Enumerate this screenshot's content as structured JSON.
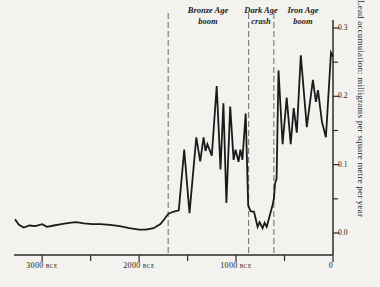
{
  "page": {
    "background_color": "#f4f2ee",
    "line_color": "#1b1b1b",
    "axis_color": "#2a2a2a",
    "dashed_line_color": "#6a6a6a"
  },
  "chart_data": {
    "type": "line",
    "title": "",
    "ylabel": "Lead accumulation: milligrams per square metre per year",
    "x_axis": {
      "unit": "years BCE",
      "range_years_bce": [
        3280,
        0
      ],
      "ticks": [
        {
          "year": 3000,
          "label": "3000",
          "era": "BCE"
        },
        {
          "year": 2000,
          "label": "2000",
          "era": "BCE"
        },
        {
          "year": 1000,
          "label": "1000",
          "era": "BCE"
        },
        {
          "year": 0,
          "label": "0",
          "era": ""
        }
      ],
      "minor_tick_years": [
        2500,
        1500,
        500
      ]
    },
    "y_axis": {
      "range": [
        0.0,
        0.3
      ],
      "ticks": [
        {
          "value": 0.3,
          "label": "0.3"
        },
        {
          "value": 0.2,
          "label": "0.2"
        },
        {
          "value": 0.1,
          "label": "0.1"
        },
        {
          "value": 0.0,
          "label": "0.0"
        }
      ],
      "minor_tick_values": [
        0.25,
        0.15,
        0.05
      ]
    },
    "annotations": [
      {
        "line1": "Bronze Age",
        "line2": "boom",
        "start_year_bce": 1700,
        "end_year_bce": 870
      },
      {
        "line1": "Dark Age",
        "line2": "crash",
        "start_year_bce": 870,
        "end_year_bce": 610
      },
      {
        "line1": "Iron Age",
        "line2": "boom",
        "start_year_bce": 610,
        "end_year_bce": 0
      }
    ],
    "divider_years_bce": [
      1700,
      870,
      610
    ],
    "series": [
      {
        "name": "lead-accumulation",
        "points_year_bce_value": [
          [
            3280,
            0.02
          ],
          [
            3240,
            0.012
          ],
          [
            3190,
            0.008
          ],
          [
            3130,
            0.011
          ],
          [
            3070,
            0.01
          ],
          [
            3000,
            0.013
          ],
          [
            2950,
            0.009
          ],
          [
            2880,
            0.011
          ],
          [
            2800,
            0.013
          ],
          [
            2720,
            0.015
          ],
          [
            2650,
            0.016
          ],
          [
            2570,
            0.014
          ],
          [
            2480,
            0.013
          ],
          [
            2400,
            0.013
          ],
          [
            2300,
            0.012
          ],
          [
            2200,
            0.01
          ],
          [
            2100,
            0.007
          ],
          [
            2000,
            0.005
          ],
          [
            1930,
            0.005
          ],
          [
            1850,
            0.007
          ],
          [
            1780,
            0.013
          ],
          [
            1740,
            0.02
          ],
          [
            1700,
            0.028
          ],
          [
            1650,
            0.031
          ],
          [
            1590,
            0.033
          ],
          [
            1535,
            0.122
          ],
          [
            1480,
            0.029
          ],
          [
            1410,
            0.14
          ],
          [
            1370,
            0.105
          ],
          [
            1335,
            0.14
          ],
          [
            1315,
            0.12
          ],
          [
            1295,
            0.13
          ],
          [
            1250,
            0.113
          ],
          [
            1200,
            0.215
          ],
          [
            1160,
            0.093
          ],
          [
            1130,
            0.19
          ],
          [
            1100,
            0.044
          ],
          [
            1060,
            0.185
          ],
          [
            1025,
            0.107
          ],
          [
            1005,
            0.122
          ],
          [
            975,
            0.104
          ],
          [
            955,
            0.122
          ],
          [
            935,
            0.107
          ],
          [
            900,
            0.175
          ],
          [
            875,
            0.04
          ],
          [
            850,
            0.032
          ],
          [
            815,
            0.031
          ],
          [
            778,
            0.009
          ],
          [
            757,
            0.016
          ],
          [
            726,
            0.007
          ],
          [
            705,
            0.015
          ],
          [
            684,
            0.009
          ],
          [
            655,
            0.024
          ],
          [
            625,
            0.04
          ],
          [
            610,
            0.05
          ],
          [
            598,
            0.072
          ],
          [
            582,
            0.08
          ],
          [
            562,
            0.238
          ],
          [
            520,
            0.13
          ],
          [
            478,
            0.198
          ],
          [
            436,
            0.13
          ],
          [
            405,
            0.183
          ],
          [
            373,
            0.147
          ],
          [
            332,
            0.26
          ],
          [
            270,
            0.155
          ],
          [
            207,
            0.224
          ],
          [
            176,
            0.192
          ],
          [
            155,
            0.209
          ],
          [
            115,
            0.163
          ],
          [
            73,
            0.14
          ],
          [
            21,
            0.264
          ],
          [
            0,
            0.258
          ]
        ]
      }
    ]
  }
}
